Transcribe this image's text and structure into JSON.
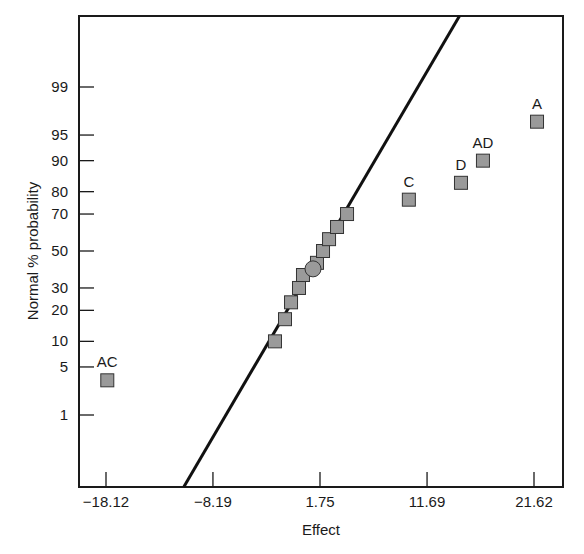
{
  "chart_data": {
    "type": "scatter",
    "title": "",
    "xlabel": "Effect",
    "ylabel": "Normal % probability",
    "xlim": [
      -20.6,
      25.0
    ],
    "x_ticks": [
      -18.12,
      -8.19,
      1.75,
      11.69,
      21.62
    ],
    "x_tick_labels": [
      "-18.12",
      "-8.19",
      "1.75",
      "11.69",
      "21.62"
    ],
    "y_scale": "normal-probability",
    "y_ticks": [
      1,
      5,
      10,
      20,
      30,
      50,
      70,
      80,
      90,
      95,
      99
    ],
    "y_tick_labels": [
      "1",
      "5",
      "10",
      "20",
      "30",
      "50",
      "70",
      "80",
      "90",
      "95",
      "99"
    ],
    "grid": false,
    "legend": null,
    "series": [
      {
        "name": "effects",
        "marker": "square",
        "color": "#9a9a9a",
        "points": [
          {
            "x": -18.0,
            "y": 3.33,
            "label": "AC"
          },
          {
            "x": -2.43,
            "y": 10.0,
            "label": ""
          },
          {
            "x": -1.5,
            "y": 16.67,
            "label": ""
          },
          {
            "x": -0.94,
            "y": 23.33,
            "label": ""
          },
          {
            "x": -0.2,
            "y": 30.0,
            "label": ""
          },
          {
            "x": 0.17,
            "y": 36.67,
            "label": ""
          },
          {
            "x": 1.47,
            "y": 43.33,
            "label": ""
          },
          {
            "x": 2.03,
            "y": 50.0,
            "label": ""
          },
          {
            "x": 2.59,
            "y": 56.67,
            "label": ""
          },
          {
            "x": 3.33,
            "y": 63.33,
            "label": ""
          },
          {
            "x": 4.26,
            "y": 70.0,
            "label": ""
          },
          {
            "x": 10.0,
            "y": 76.67,
            "label": "C"
          },
          {
            "x": 14.84,
            "y": 83.33,
            "label": "D"
          },
          {
            "x": 16.88,
            "y": 90.0,
            "label": "AD"
          },
          {
            "x": 21.9,
            "y": 96.67,
            "label": "A"
          }
        ]
      },
      {
        "name": "center-point",
        "marker": "circle",
        "color": "#9a9a9a",
        "points": [
          {
            "x": 1.1,
            "y": 40.0,
            "label": ""
          }
        ]
      }
    ],
    "reference_line": {
      "name": "normal-fit-line",
      "from": {
        "x": -10.9,
        "y_px": 487
      },
      "to": {
        "x": 14.7,
        "y_px": 16
      }
    },
    "annotations": [
      "AC",
      "C",
      "D",
      "AD",
      "A"
    ]
  },
  "labels": {
    "xlabel": "Effect",
    "ylabel": "Normal % probability"
  }
}
